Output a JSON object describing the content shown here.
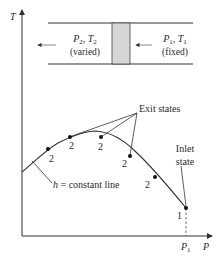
{
  "axes": {
    "y_label": "T",
    "x_label": "P",
    "x_tick": "P",
    "x_tick_sub": "1"
  },
  "device": {
    "left": {
      "p": "P",
      "p_sub": "2",
      "sep": ", ",
      "t": "T",
      "t_sub": "2",
      "note": "(varied)"
    },
    "right": {
      "p": "P",
      "p_sub": "1",
      "sep": ", ",
      "t": "T",
      "t_sub": "1",
      "note": "(fixed)"
    },
    "plug_color": "#d6d6d6"
  },
  "curve": {
    "label_h": "h",
    "label_rest": " = constant line"
  },
  "points": {
    "exit_label": "2",
    "inlet_label": "1"
  },
  "annotations": {
    "exit_states": "Exit states",
    "inlet_line1": "Inlet",
    "inlet_line2": "state"
  }
}
